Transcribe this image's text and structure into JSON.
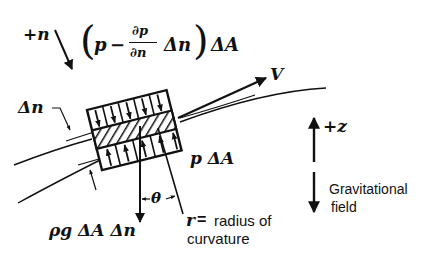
{
  "diagram": {
    "type": "free-body diagram of fluid element on curved streamline",
    "labels": {
      "plus_n": "+n",
      "top_force_open": "(",
      "top_force_p": "p",
      "top_force_minus": "−",
      "top_force_dp": "∂p",
      "top_force_dn": "∂n",
      "top_force_delta_n": "Δn",
      "top_force_close": ")",
      "top_force_dA": "ΔA",
      "delta_n": "Δn",
      "velocity": "V",
      "bottom_force": "p ΔA",
      "weight": "ρg ΔA Δn",
      "theta": "θ",
      "r_symbol": "r",
      "r_dash": "=",
      "radius_line1": "radius of",
      "radius_line2": "curvature",
      "plus_z": "+z",
      "gravity_line1": "Gravitational",
      "gravity_line2": "field"
    },
    "colors": {
      "ink": "#111111",
      "background": "#ffffff"
    }
  }
}
